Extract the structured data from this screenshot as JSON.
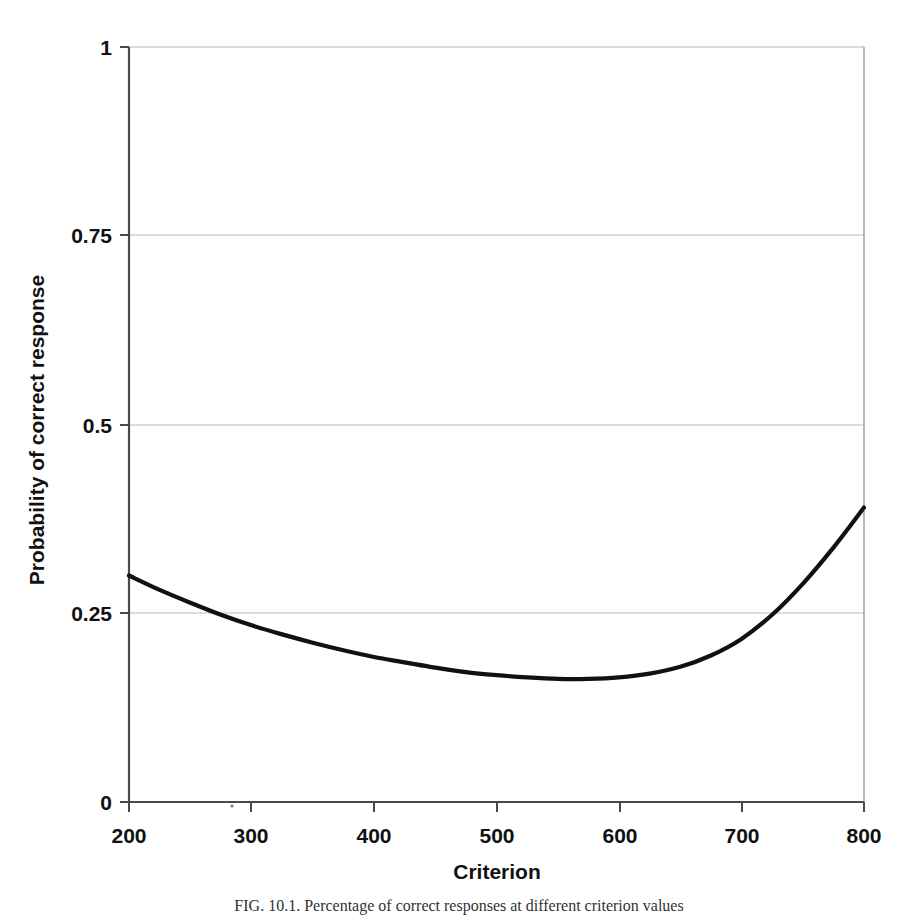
{
  "figure": {
    "caption": "FIG. 10.1.   Percentage of correct responses at different criterion values"
  },
  "chart_data": {
    "type": "line",
    "title": "",
    "subtitle": "",
    "xlabel": "Criterion",
    "ylabel": "Probability of correct response",
    "xlim": [
      200,
      800
    ],
    "ylim": [
      0,
      1
    ],
    "xticks": [
      200,
      300,
      400,
      500,
      600,
      700,
      800
    ],
    "xtick_labels": [
      "200",
      "300",
      "400",
      "500",
      "600",
      "700",
      "800"
    ],
    "yticks": [
      0,
      0.25,
      0.5,
      0.75,
      1
    ],
    "ytick_labels": [
      "0",
      "0.25",
      "0.5",
      "0.75",
      "1"
    ],
    "grid": "horizontal",
    "legend": "none",
    "series": [
      {
        "name": "Probability of correct response",
        "color": "#111111",
        "x": [
          200,
          225,
          250,
          275,
          300,
          325,
          350,
          375,
          400,
          425,
          450,
          475,
          500,
          525,
          550,
          575,
          600,
          625,
          650,
          675,
          700,
          725,
          750,
          775,
          800
        ],
        "values": [
          0.3,
          0.281,
          0.264,
          0.248,
          0.234,
          0.222,
          0.211,
          0.201,
          0.192,
          0.185,
          0.178,
          0.172,
          0.168,
          0.165,
          0.163,
          0.163,
          0.165,
          0.17,
          0.179,
          0.194,
          0.216,
          0.248,
          0.289,
          0.337,
          0.39
        ]
      }
    ],
    "annotations": []
  },
  "axes": {
    "y_label": "Probability of correct response",
    "x_label": "Criterion",
    "y_tick_0": "0",
    "y_tick_1": "0.25",
    "y_tick_2": "0.5",
    "y_tick_3": "0.75",
    "y_tick_4": "1",
    "x_tick_0": "200",
    "x_tick_1": "300",
    "x_tick_2": "400",
    "x_tick_3": "500",
    "x_tick_4": "600",
    "x_tick_5": "700",
    "x_tick_6": "800"
  },
  "colors": {
    "curve": "#111111",
    "grid": "#b9b9b9",
    "axis": "#4a4a4a",
    "background": "#ffffff"
  }
}
